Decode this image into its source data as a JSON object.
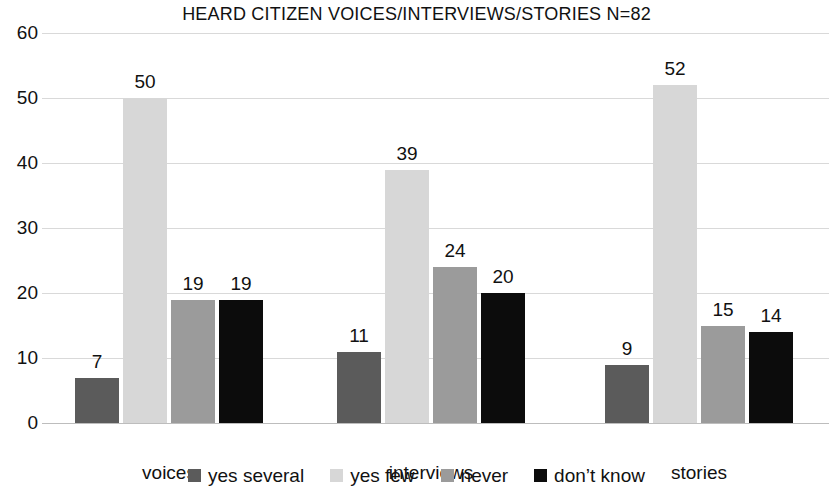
{
  "chart_data": {
    "type": "bar",
    "title": "HEARD CITIZEN VOICES/INTERVIEWS/STORIES N=82",
    "xlabel": "",
    "ylabel": "",
    "ylim": [
      0,
      60
    ],
    "yticks": [
      0,
      10,
      20,
      30,
      40,
      50,
      60
    ],
    "grid": true,
    "legend_position": "bottom",
    "categories": [
      "voices",
      "interviews",
      "stories"
    ],
    "series": [
      {
        "name": "yes several",
        "color": "#5b5b5b",
        "values": [
          7,
          11,
          9
        ]
      },
      {
        "name": "yes few",
        "color": "#d7d7d7",
        "values": [
          50,
          39,
          52
        ]
      },
      {
        "name": "never",
        "color": "#9b9b9b",
        "values": [
          19,
          24,
          15
        ]
      },
      {
        "name": "don’t know",
        "color": "#0c0c0c",
        "values": [
          19,
          20,
          14
        ]
      }
    ]
  },
  "axis": {
    "ytick_labels": [
      "60",
      "50",
      "40",
      "30",
      "20",
      "10",
      "0"
    ],
    "category_labels": [
      "voices",
      "interviews",
      "stories"
    ]
  },
  "legend": {
    "items": [
      {
        "label": "yes several"
      },
      {
        "label": "yes few"
      },
      {
        "label": "never"
      },
      {
        "label": "don’t know"
      }
    ]
  },
  "bar_value_labels": {
    "voices": [
      "7",
      "50",
      "19",
      "19"
    ],
    "interviews": [
      "11",
      "39",
      "24",
      "20"
    ],
    "stories": [
      "9",
      "52",
      "15",
      "14"
    ]
  }
}
